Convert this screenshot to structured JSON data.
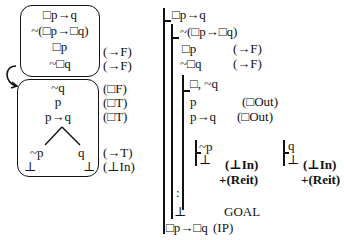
{
  "tree": {
    "box1": {
      "lines": [
        "□p→q",
        "~(□p→□q)",
        "□p",
        "~□q"
      ],
      "rules": [
        "",
        "",
        "(→F)",
        "(→F)"
      ]
    },
    "box2": {
      "lines": [
        "~q",
        "p",
        "p→q"
      ],
      "rules": [
        "(□F)",
        "(□T)",
        "(□T)"
      ],
      "branch_left": [
        "~p",
        "⊥"
      ],
      "branch_right": [
        "q",
        "⊥"
      ],
      "branch_rules": [
        "(→T)",
        "(⊥In)"
      ]
    },
    "arrow_icon": "curved-arrow"
  },
  "proof": {
    "line1": "□p→q",
    "line2": "~(□p→□q)",
    "line3": "□p",
    "line3_rule": "(→F)",
    "line4": "~□q",
    "line4_rule": "(→F)",
    "sub_head": "□, ~q",
    "sub_line1": "p",
    "sub_line1_rule": "(□Out)",
    "sub_line2": "p→q",
    "sub_line2_rule": "(□Out)",
    "case1_assume": "~p",
    "case1_bottom": "⊥",
    "case1_rule1": "(⊥In)",
    "case1_rule2": "+(Reit)",
    "case2_assume": "q",
    "case2_bottom": "⊥",
    "case2_rule1": "(⊥In)",
    "case2_rule2": "+(Reit)",
    "dots": ":",
    "bottom": "⊥",
    "goal": "GOAL",
    "conclusion": "□p→□q",
    "conclusion_rule": "(IP)"
  }
}
